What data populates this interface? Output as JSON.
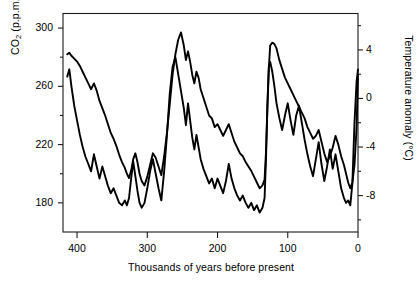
{
  "chart_data": {
    "type": "line",
    "title": "",
    "xlabel": "Thousands of years before present",
    "ylabel_left": "CO2 (p.p.m.)",
    "ylabel_right": "Temperature anomaly (°C)",
    "grid": false,
    "legend": "none",
    "x_axis": {
      "label": "Thousands of years before present",
      "ticks": [
        400,
        300,
        200,
        100,
        0
      ],
      "tick_labels": [
        "400",
        "300",
        "200",
        "100",
        "0"
      ],
      "xlim": [
        420,
        0
      ],
      "direction": "reversed",
      "minor_ticks": false
    },
    "y_axis_left": {
      "label": "CO2 (p.p.m.)",
      "label_html": "CO<sub>2</sub> (p.p.m.)",
      "ticks": [
        300,
        260,
        220,
        180
      ],
      "tick_labels": [
        "300",
        "260",
        "220",
        "180"
      ],
      "ylim": [
        160,
        310
      ],
      "minor_ticks": [
        280,
        240,
        200
      ],
      "applies_to_series": "co2"
    },
    "y_axis_right": {
      "label": "Temperature anomaly (°C)",
      "ticks": [
        4,
        0,
        -4,
        -8
      ],
      "tick_labels": [
        "4",
        "0",
        "-4",
        "-8"
      ],
      "ylim": [
        -11,
        7
      ],
      "minor_ticks": [
        6,
        2,
        -2,
        -6,
        -10
      ],
      "applies_to_series": "temperature"
    },
    "series": [
      {
        "name": "co2",
        "axis": "left",
        "units": "p.p.m.",
        "color": "#000000",
        "x": [
          414,
          411,
          408,
          404,
          400,
          396,
          392,
          388,
          384,
          380,
          376,
          372,
          368,
          364,
          360,
          356,
          352,
          348,
          344,
          340,
          336,
          332,
          329,
          326,
          323,
          320,
          317,
          314,
          311,
          308,
          304,
          300,
          296,
          292,
          288,
          284,
          280,
          276,
          272,
          268,
          264,
          260,
          256,
          252,
          248,
          245,
          242,
          239,
          236,
          233,
          230,
          227,
          224,
          220,
          216,
          212,
          208,
          204,
          200,
          196,
          192,
          188,
          184,
          180,
          176,
          172,
          168,
          164,
          160,
          156,
          152,
          148,
          144,
          140,
          136,
          133,
          131,
          129,
          127,
          125,
          122,
          119,
          116,
          112,
          108,
          104,
          100,
          96,
          92,
          88,
          84,
          80,
          76,
          72,
          68,
          64,
          60,
          56,
          52,
          48,
          44,
          40,
          36,
          32,
          28,
          24,
          20,
          17,
          14,
          11,
          8,
          5,
          2,
          0
        ],
        "y": [
          282,
          283,
          281,
          279,
          277,
          274,
          270,
          266,
          262,
          258,
          262,
          257,
          250,
          245,
          240,
          234,
          228,
          224,
          219,
          213,
          208,
          204,
          200,
          197,
          202,
          210,
          214,
          208,
          200,
          195,
          192,
          198,
          206,
          214,
          211,
          205,
          199,
          212,
          228,
          248,
          268,
          282,
          292,
          297,
          288,
          278,
          284,
          277,
          268,
          262,
          270,
          266,
          258,
          252,
          246,
          240,
          238,
          232,
          234,
          230,
          226,
          230,
          234,
          228,
          222,
          218,
          214,
          212,
          208,
          205,
          202,
          198,
          194,
          190,
          192,
          196,
          215,
          245,
          272,
          288,
          290,
          289,
          286,
          278,
          272,
          266,
          262,
          258,
          254,
          250,
          246,
          242,
          238,
          232,
          228,
          224,
          226,
          230,
          222,
          214,
          208,
          212,
          218,
          226,
          220,
          212,
          206,
          200,
          194,
          190,
          194,
          206,
          232,
          268
        ]
      },
      {
        "name": "temperature",
        "axis": "right",
        "units": "°C",
        "color": "#000000",
        "x": [
          414,
          411,
          408,
          404,
          400,
          396,
          392,
          388,
          384,
          380,
          376,
          372,
          368,
          364,
          360,
          356,
          352,
          348,
          344,
          340,
          336,
          332,
          329,
          326,
          323,
          320,
          317,
          314,
          311,
          308,
          304,
          300,
          296,
          292,
          288,
          284,
          280,
          276,
          272,
          268,
          264,
          260,
          256,
          252,
          248,
          245,
          242,
          239,
          236,
          233,
          230,
          227,
          224,
          220,
          216,
          212,
          208,
          204,
          200,
          196,
          192,
          188,
          184,
          180,
          176,
          172,
          168,
          164,
          160,
          156,
          152,
          148,
          144,
          140,
          136,
          133,
          131,
          129,
          127,
          125,
          122,
          119,
          116,
          112,
          108,
          104,
          100,
          96,
          92,
          88,
          84,
          80,
          76,
          72,
          68,
          64,
          60,
          56,
          52,
          48,
          44,
          40,
          36,
          32,
          28,
          24,
          20,
          17,
          14,
          11,
          8,
          5,
          2,
          0
        ],
        "y": [
          1.8,
          2.4,
          1.0,
          -0.6,
          -1.8,
          -3.0,
          -4.0,
          -4.8,
          -5.4,
          -6.0,
          -4.6,
          -5.6,
          -6.6,
          -5.6,
          -6.4,
          -7.2,
          -7.8,
          -7.4,
          -8.0,
          -8.6,
          -8.8,
          -8.4,
          -8.8,
          -8.2,
          -6.6,
          -5.2,
          -6.4,
          -7.6,
          -8.6,
          -9.0,
          -8.6,
          -7.4,
          -6.0,
          -5.0,
          -6.2,
          -7.4,
          -8.4,
          -6.0,
          -3.0,
          0.4,
          2.6,
          3.4,
          2.0,
          0.6,
          -0.8,
          -2.2,
          -0.4,
          -1.8,
          -3.2,
          -4.2,
          -3.0,
          -4.0,
          -5.0,
          -5.8,
          -6.4,
          -7.0,
          -6.6,
          -7.4,
          -6.6,
          -7.2,
          -7.8,
          -6.8,
          -5.4,
          -6.6,
          -7.4,
          -8.0,
          -8.4,
          -8.0,
          -8.6,
          -9.0,
          -8.6,
          -9.2,
          -8.8,
          -9.4,
          -9.0,
          -8.2,
          -5.0,
          -0.6,
          2.6,
          3.0,
          2.2,
          1.0,
          -0.4,
          -1.6,
          -2.6,
          -1.4,
          -0.4,
          -1.8,
          -3.0,
          -1.4,
          -0.6,
          -2.0,
          -3.4,
          -4.6,
          -5.6,
          -6.4,
          -5.0,
          -3.6,
          -5.4,
          -6.8,
          -5.6,
          -4.2,
          -5.8,
          -4.6,
          -6.0,
          -7.4,
          -8.2,
          -8.6,
          -8.4,
          -8.8,
          -7.0,
          -2.0,
          1.4,
          2.4
        ]
      }
    ]
  },
  "axis_titles": {
    "left": "CO2 (p.p.m.)",
    "right": "Temperature anomaly (°C)",
    "bottom": "Thousands of years before present"
  },
  "colors": {
    "line": "#000000",
    "axis": "#1a1a1a",
    "background": "#ffffff"
  }
}
